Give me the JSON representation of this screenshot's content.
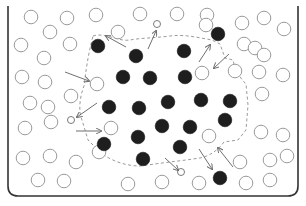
{
  "diagram": {
    "colors": {
      "container": "#333333",
      "filled_particle": "#1e1e1e",
      "open_particle_stroke": "#9a9a9a",
      "boundary": "#9a9a9a",
      "arrow": "#6f6f6f"
    },
    "filled_particles": [
      [
        98,
        46
      ],
      [
        136,
        56
      ],
      [
        184,
        51
      ],
      [
        218,
        34
      ],
      [
        123,
        77
      ],
      [
        150,
        78
      ],
      [
        185,
        77
      ],
      [
        109,
        107
      ],
      [
        139,
        108
      ],
      [
        168,
        102
      ],
      [
        201,
        100
      ],
      [
        230,
        101
      ],
      [
        225,
        120
      ],
      [
        104,
        144
      ],
      [
        138,
        137
      ],
      [
        162,
        126
      ],
      [
        190,
        127
      ],
      [
        180,
        147
      ],
      [
        143,
        159
      ],
      [
        220,
        178
      ]
    ],
    "open_particles": [
      [
        31,
        17
      ],
      [
        67,
        18
      ],
      [
        96,
        15
      ],
      [
        140,
        14
      ],
      [
        177,
        14
      ],
      [
        207,
        15
      ],
      [
        242,
        23
      ],
      [
        264,
        18
      ],
      [
        284,
        29
      ],
      [
        50,
        32
      ],
      [
        118,
        32
      ],
      [
        206,
        25
      ],
      [
        21,
        45
      ],
      [
        70,
        44
      ],
      [
        244,
        44
      ],
      [
        255,
        48
      ],
      [
        44,
        58
      ],
      [
        264,
        55
      ],
      [
        22,
        77
      ],
      [
        45,
        82
      ],
      [
        97,
        84
      ],
      [
        202,
        73
      ],
      [
        235,
        71
      ],
      [
        259,
        72
      ],
      [
        283,
        75
      ],
      [
        30,
        103
      ],
      [
        48,
        107
      ],
      [
        71,
        96
      ],
      [
        262,
        94
      ],
      [
        25,
        128
      ],
      [
        51,
        122
      ],
      [
        111,
        128
      ],
      [
        209,
        136
      ],
      [
        261,
        132
      ],
      [
        283,
        135
      ],
      [
        23,
        158
      ],
      [
        50,
        156
      ],
      [
        76,
        162
      ],
      [
        99,
        152
      ],
      [
        240,
        162
      ],
      [
        270,
        160
      ],
      [
        287,
        156
      ],
      [
        38,
        180
      ],
      [
        64,
        181
      ],
      [
        128,
        184
      ],
      [
        162,
        182
      ],
      [
        199,
        183
      ],
      [
        246,
        183
      ],
      [
        270,
        180
      ]
    ],
    "small_open_particles": [
      [
        157,
        24
      ],
      [
        71,
        120
      ],
      [
        181,
        172
      ]
    ],
    "boundary_path": "M 93 36 C 105 32, 118 42, 130 40 C 140 38, 155 38, 170 36 C 185 34, 200 38, 212 40 L 220 44 L 225 58 L 233 60 C 235 70, 240 78, 246 84 L 248 105 L 246 130 L 238 140 L 224 142 C 218 150, 210 156, 200 158 L 186 160 L 162 163 L 140 166 C 125 166, 108 160, 98 150 L 88 140 L 82 120 C 78 110, 80 96, 84 86 C 86 70, 88 55, 93 36 Z",
    "arrows": [
      {
        "from": [
          126,
          47
        ],
        "to": [
          106,
          36
        ]
      },
      {
        "from": [
          148,
          49
        ],
        "to": [
          156,
          31
        ]
      },
      {
        "from": [
          199,
          62
        ],
        "to": [
          210,
          45
        ]
      },
      {
        "from": [
          229,
          54
        ],
        "to": [
          214,
          68
        ]
      },
      {
        "from": [
          65,
          72
        ],
        "to": [
          89,
          81
        ]
      },
      {
        "from": [
          97,
          103
        ],
        "to": [
          77,
          117
        ]
      },
      {
        "from": [
          76,
          131
        ],
        "to": [
          101,
          131
        ]
      },
      {
        "from": [
          165,
          158
        ],
        "to": [
          178,
          170
        ]
      },
      {
        "from": [
          199,
          149
        ],
        "to": [
          212,
          169
        ]
      },
      {
        "from": [
          233,
          167
        ],
        "to": [
          218,
          148
        ]
      }
    ]
  }
}
